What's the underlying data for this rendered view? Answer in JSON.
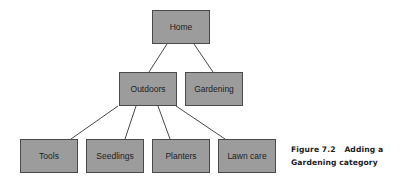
{
  "diagram": {
    "type": "tree",
    "nodes": {
      "home": {
        "label": "Home"
      },
      "outdoors": {
        "label": "Outdoors"
      },
      "gardening": {
        "label": "Gardening"
      },
      "tools": {
        "label": "Tools"
      },
      "seedlings": {
        "label": "Seedlings"
      },
      "planters": {
        "label": "Planters"
      },
      "lawn_care": {
        "label": "Lawn care"
      }
    },
    "edges": [
      [
        "Home",
        "Outdoors"
      ],
      [
        "Home",
        "Gardening"
      ],
      [
        "Outdoors",
        "Tools"
      ],
      [
        "Outdoors",
        "Seedlings"
      ],
      [
        "Outdoors",
        "Planters"
      ],
      [
        "Outdoors",
        "Lawn care"
      ]
    ]
  },
  "caption": {
    "figure_number": "Figure 7.2",
    "line1": "Adding a",
    "line2": "Gardening category"
  }
}
